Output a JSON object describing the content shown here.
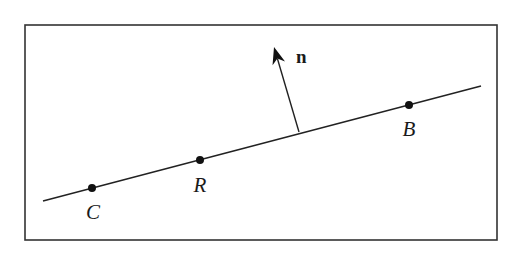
{
  "diagram": {
    "type": "line-with-normal-vector",
    "frame": {
      "x": 25,
      "y": 25,
      "width": 472,
      "height": 215,
      "stroke": "#333333"
    },
    "line": {
      "x1": 43,
      "y1": 201,
      "x2": 481,
      "y2": 86,
      "stroke": "#222222"
    },
    "points": [
      {
        "id": "C",
        "label": "C",
        "cx": 92,
        "cy": 188,
        "lx": 93,
        "ly": 219
      },
      {
        "id": "R",
        "label": "R",
        "cx": 200,
        "cy": 160,
        "lx": 200,
        "ly": 192
      },
      {
        "id": "B",
        "label": "B",
        "cx": 409,
        "cy": 105,
        "lx": 409,
        "ly": 136
      }
    ],
    "normal": {
      "label": "n",
      "base_x": 299,
      "base_y": 132,
      "tip_x": 274,
      "tip_y": 47,
      "label_x": 296,
      "label_y": 63
    }
  }
}
